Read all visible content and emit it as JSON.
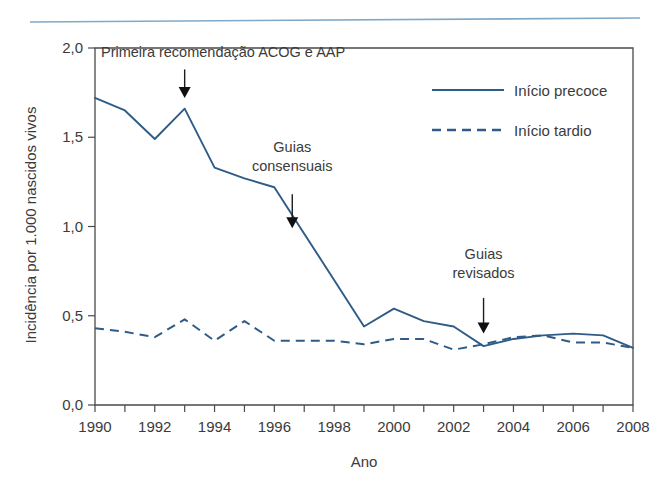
{
  "figure": {
    "top_rule_color": "#7fa9c9",
    "line_color": "#2e5c86",
    "text_color": "#3b3b3b"
  },
  "chart_data": {
    "type": "line",
    "title": "",
    "xlabel": "Ano",
    "ylabel": "Incidência por 1.000 nascidos vivos",
    "xlim": [
      1990,
      2008
    ],
    "ylim": [
      0.0,
      2.0
    ],
    "grid": false,
    "legend_position": "top-right",
    "x": [
      1990,
      1991,
      1992,
      1993,
      1994,
      1995,
      1996,
      1997,
      1998,
      1999,
      2000,
      2001,
      2002,
      2003,
      2004,
      2005,
      2006,
      2007,
      2008
    ],
    "xticks": [
      1990,
      1991,
      1992,
      1993,
      1994,
      1995,
      1996,
      1997,
      1998,
      1999,
      2000,
      2001,
      2002,
      2003,
      2004,
      2005,
      2006,
      2007,
      2008
    ],
    "xtick_labels": [
      "1990",
      "",
      "1992",
      "",
      "1994",
      "",
      "1996",
      "",
      "1998",
      "",
      "2000",
      "",
      "2002",
      "",
      "2004",
      "",
      "2006",
      "",
      "2008"
    ],
    "yticks": [
      0.0,
      0.5,
      1.0,
      1.5,
      2.0
    ],
    "ytick_labels": [
      "0,0",
      "0,5",
      "1,0",
      "1,5",
      "2,0"
    ],
    "series": [
      {
        "name": "Início precoce",
        "style": "solid",
        "color": "#2e5c86",
        "values": [
          1.72,
          1.65,
          1.49,
          1.66,
          1.33,
          1.27,
          1.22,
          0.96,
          0.7,
          0.44,
          0.54,
          0.47,
          0.44,
          0.33,
          0.37,
          0.39,
          0.4,
          0.39,
          0.32
        ]
      },
      {
        "name": "Início tardio",
        "style": "dashed",
        "color": "#2e5c86",
        "values": [
          0.43,
          0.41,
          0.38,
          0.48,
          0.36,
          0.47,
          0.36,
          0.36,
          0.36,
          0.34,
          0.37,
          0.37,
          0.31,
          0.34,
          0.38,
          0.39,
          0.35,
          0.35,
          0.32
        ]
      }
    ],
    "annotations": [
      {
        "id": "primeira-recomendacao",
        "lines": [
          "Primeira recomendação ACOG e AAP"
        ],
        "text_x": 1990.2,
        "text_y": 1.95,
        "text_anchor": "start",
        "arrow_x": 1993.0,
        "arrow_y_start": 1.88,
        "arrow_y_end": 1.72
      },
      {
        "id": "guias-consensuais",
        "lines": [
          "Guias",
          "consensuais"
        ],
        "text_x": 1996.6,
        "text_y": 1.42,
        "text_anchor": "middle",
        "arrow_x": 1996.6,
        "arrow_y_start": 1.18,
        "arrow_y_end": 0.99
      },
      {
        "id": "guias-revisados",
        "lines": [
          "Guias",
          "revisados"
        ],
        "text_x": 2003.0,
        "text_y": 0.82,
        "text_anchor": "middle",
        "arrow_x": 2003.0,
        "arrow_y_start": 0.6,
        "arrow_y_end": 0.4
      }
    ],
    "legend": [
      {
        "label": "Início precoce",
        "style": "solid"
      },
      {
        "label": "Início tardio",
        "style": "dashed"
      }
    ]
  }
}
